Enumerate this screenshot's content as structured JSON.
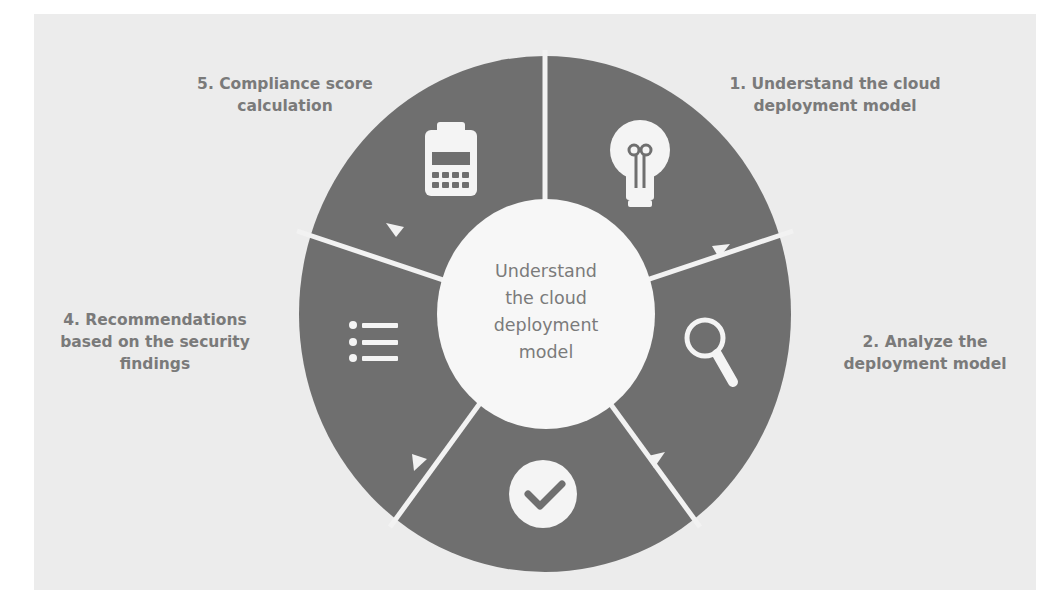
{
  "diagram": {
    "center_label": [
      "Understand",
      "the cloud",
      "deployment",
      "model"
    ],
    "steps": [
      {
        "number": 1,
        "label_lines": [
          "1. Understand the cloud",
          "deployment model"
        ],
        "icon": "lightbulb-icon"
      },
      {
        "number": 2,
        "label_lines": [
          "2. Analyze the",
          "deployment model"
        ],
        "icon": "magnifier-icon"
      },
      {
        "number": 3,
        "label_lines": [],
        "icon": "checkmark-circle-icon"
      },
      {
        "number": 4,
        "label_lines": [
          "4. Recommendations",
          "based on the security",
          "findings"
        ],
        "icon": "list-icon"
      },
      {
        "number": 5,
        "label_lines": [
          "5. Compliance score",
          "calculation"
        ],
        "icon": "calculator-icon"
      }
    ],
    "colors": {
      "segment": "#6f6f6f",
      "divider": "#f2f2f2",
      "center": "#f7f7f7",
      "label_text": "#7a7a7a",
      "paper": "#ececec"
    }
  }
}
